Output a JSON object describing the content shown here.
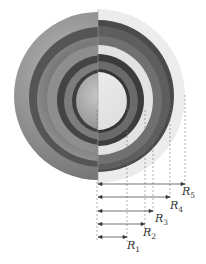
{
  "figure": {
    "shells": [
      {
        "name": "R1",
        "label": "R",
        "subscript": "1",
        "radius_px": 29
      },
      {
        "name": "R2",
        "label": "R",
        "subscript": "2",
        "radius_px": 46
      },
      {
        "name": "R3",
        "label": "R",
        "subscript": "3",
        "radius_px": 55
      },
      {
        "name": "R4",
        "label": "R",
        "subscript": "4",
        "radius_px": 72
      },
      {
        "name": "R5",
        "label": "R",
        "subscript": "5",
        "radius_px": 87
      }
    ],
    "colors": {
      "outer_shell": "#8a8a8a",
      "dark_gap": "#3a3a3a",
      "light_face": "#e6e6e6",
      "arrow": "#333333",
      "dashed": "#888888"
    }
  }
}
